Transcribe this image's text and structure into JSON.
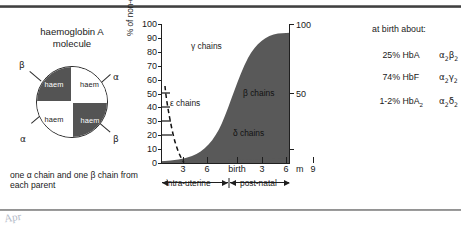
{
  "molecule": {
    "title_line1": "haemoglobin A",
    "title_line2": "molecule",
    "quadrants": [
      {
        "pos": "top-left",
        "haem": "haem",
        "chain": "β"
      },
      {
        "pos": "top-right",
        "haem": "haem",
        "chain": "α"
      },
      {
        "pos": "bottom-left",
        "haem": "haem",
        "chain": "α"
      },
      {
        "pos": "bottom-right",
        "haem": "haem",
        "chain": "β"
      }
    ],
    "label_beta_top": "β",
    "label_alpha_top": "α",
    "label_alpha_bottom": "α",
    "label_beta_bottom": "β",
    "note": "one α chain and one β chain from each parent"
  },
  "chart_data": {
    "type": "area",
    "title": "",
    "xlabel": "",
    "ylabel": "% of non-α chains present",
    "ylim": [
      0,
      100
    ],
    "yticks": [
      0,
      10,
      20,
      30,
      40,
      50,
      60,
      70,
      80,
      90,
      100
    ],
    "ytick_labels": [
      "0",
      "10",
      "20",
      "30",
      "40",
      "50",
      "60",
      "70",
      "80",
      "90",
      "100"
    ],
    "right_axis_ticks": [
      50,
      100
    ],
    "right_axis_labels": [
      "50",
      "100"
    ],
    "xticks": [
      "3",
      "6",
      "birth",
      "3",
      "6",
      "9"
    ],
    "x_unit_label": "m",
    "grid": false,
    "legend": "inline",
    "period_labels": [
      "intra-uterine",
      "post-natal"
    ],
    "series": [
      {
        "name": "ε chains",
        "style": "dashed-line",
        "x": [
          0,
          0.6,
          1.2,
          1.8,
          2.4,
          3.0,
          3.4
        ],
        "values": [
          55,
          50,
          38,
          22,
          9,
          2,
          0
        ]
      },
      {
        "name": "γ chains",
        "style": "white-area",
        "x": [
          0,
          3,
          6,
          9,
          12,
          15,
          18,
          21
        ],
        "values": [
          45,
          98,
          97,
          92,
          72,
          38,
          12,
          4
        ]
      },
      {
        "name": "β chains",
        "style": "dark-area",
        "x": [
          0,
          3,
          6,
          9,
          12,
          15,
          18,
          21
        ],
        "values": [
          0,
          2,
          3,
          8,
          28,
          62,
          88,
          96
        ]
      },
      {
        "name": "δ chains",
        "style": "thin-dark-band",
        "x": [
          0,
          6,
          12,
          21
        ],
        "values": [
          0,
          1,
          2,
          3
        ]
      }
    ],
    "annotations": [
      {
        "text": "γ chains",
        "region": "white-upper-left"
      },
      {
        "text": "ε chains",
        "region": "white-lower-left"
      },
      {
        "text": "β chains",
        "region": "dark-right"
      },
      {
        "text": "δ chains",
        "region": "dark-lower"
      }
    ]
  },
  "birth_panel": {
    "title": "at birth about:",
    "rows": [
      {
        "pct": "25%",
        "name": "HbA",
        "formula_alpha": "α",
        "formula_alpha_sub": "2",
        "formula_other": "β",
        "formula_other_sub": "2"
      },
      {
        "pct": "74%",
        "name": "HbF",
        "formula_alpha": "α",
        "formula_alpha_sub": "2",
        "formula_other": "γ",
        "formula_other_sub": "2"
      },
      {
        "pct": "1-2%",
        "name": "HbA",
        "name_sub": "2",
        "formula_alpha": "α",
        "formula_alpha_sub": "2",
        "formula_other": "δ",
        "formula_other_sub": "2"
      }
    ]
  },
  "margin_mark": "Apr"
}
